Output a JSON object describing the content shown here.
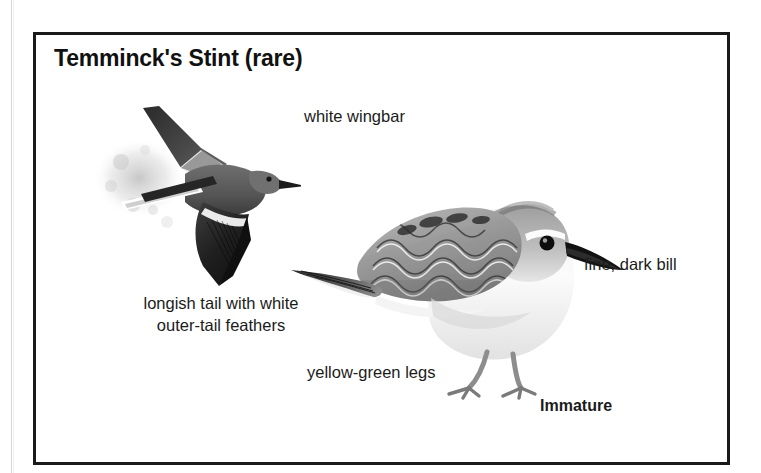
{
  "page": {
    "background_color": "#ffffff",
    "frame_color": "#1a1a1a"
  },
  "plate": {
    "title": "Temminck's Stint (rare)",
    "callouts": [
      {
        "id": "white-wingbar",
        "text": "white wingbar"
      },
      {
        "id": "fine-dark-bill",
        "text": "fine, dark bill"
      },
      {
        "id": "longish-tail",
        "line1": "longish tail with white",
        "line2": "outer-tail feathers"
      },
      {
        "id": "yellow-green-legs",
        "text": "yellow-green legs"
      },
      {
        "id": "age-label",
        "text": "Immature"
      }
    ],
    "figures": [
      {
        "id": "flying-bird",
        "description": "Temminck's Stint in flight, dark upperwings, white outer-tail feathers"
      },
      {
        "id": "standing-bird",
        "description": "Immature Temminck's Stint standing in profile facing right"
      }
    ]
  }
}
